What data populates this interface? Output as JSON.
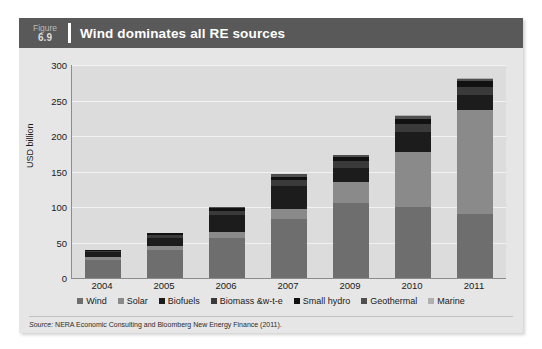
{
  "page_header": "",
  "figure": {
    "label_word": "Figure",
    "number": "6.9",
    "title": "Wind dominates all RE sources"
  },
  "source": {
    "prefix": "Source:",
    "text": " NERA Economic Consulting and Bloomberg New Energy Finance (2011)."
  },
  "colors": {
    "card_bg": "#e6e6e6",
    "title_bar": "#595959",
    "plot_bg": "#dcdcdc",
    "gridline": "#f2f2f2",
    "axis": "#8c8c8c",
    "wind": "#6e6e6e",
    "solar": "#8a8a8a",
    "biofuels": "#1c1c1c",
    "biomass": "#3a3a3a",
    "small_hydro": "#111111",
    "geothermal": "#4f4f4f",
    "marine": "#b0b0b0"
  },
  "chart_data": {
    "type": "bar",
    "stacked": true,
    "title": "Wind dominates all RE sources",
    "xlabel": "",
    "ylabel": "USD billion",
    "ylim": [
      0,
      300
    ],
    "yticks": [
      0,
      50,
      100,
      150,
      200,
      250,
      300
    ],
    "grid": true,
    "legend_position": "bottom",
    "categories": [
      "2004",
      "2005",
      "2006",
      "2007",
      "2009",
      "2010",
      "2011"
    ],
    "series": [
      {
        "name": "Wind",
        "color": "#6e6e6e",
        "values": [
          26,
          39,
          56,
          83,
          105,
          100,
          90
        ]
      },
      {
        "name": "Solar",
        "color": "#8a8a8a",
        "values": [
          4,
          6,
          9,
          14,
          30,
          77,
          147
        ]
      },
      {
        "name": "Biofuels",
        "color": "#1c1c1c",
        "values": [
          6,
          12,
          24,
          32,
          20,
          28,
          21
        ]
      },
      {
        "name": "Biomass &w-t-e",
        "color": "#3a3a3a",
        "values": [
          2,
          4,
          6,
          9,
          10,
          12,
          11
        ]
      },
      {
        "name": "Small hydro",
        "color": "#111111",
        "values": [
          1,
          2,
          3,
          5,
          5,
          7,
          8
        ]
      },
      {
        "name": "Geothermal",
        "color": "#4f4f4f",
        "values": [
          1,
          1,
          2,
          3,
          3,
          4,
          4
        ]
      },
      {
        "name": "Marine",
        "color": "#b0b0b0",
        "values": [
          0,
          0,
          0,
          1,
          1,
          1,
          1
        ]
      }
    ],
    "totals": [
      40,
      64,
      100,
      147,
      174,
      229,
      282
    ]
  }
}
